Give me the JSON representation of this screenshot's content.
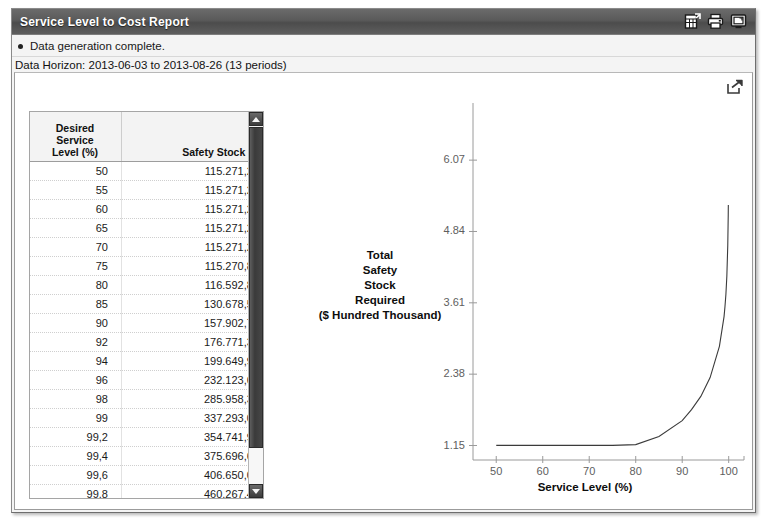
{
  "window": {
    "title": "Service Level to Cost Report",
    "icons": [
      {
        "name": "export-grid-icon",
        "label": "Export to spreadsheet"
      },
      {
        "name": "printer-icon",
        "label": "Print"
      },
      {
        "name": "display-icon",
        "label": "Display"
      }
    ]
  },
  "messages": {
    "status": "Data generation complete.",
    "horizon": "Data Horizon: 2013-06-03 to 2013-08-26 (13 periods)"
  },
  "content": {
    "export_icon": "share-export-icon"
  },
  "table": {
    "columns": [
      {
        "key": "level",
        "header_lines": [
          "Desired",
          "Service",
          "Level (%)"
        ],
        "header": "Desired Service Level (%)"
      },
      {
        "key": "stock",
        "header_lines": [
          "Safety Stock ($)"
        ],
        "header": "Safety Stock ($)"
      }
    ],
    "rows": [
      {
        "level": "50",
        "stock": "115.271,24"
      },
      {
        "level": "55",
        "stock": "115.271,24"
      },
      {
        "level": "60",
        "stock": "115.271,24"
      },
      {
        "level": "65",
        "stock": "115.271,24"
      },
      {
        "level": "70",
        "stock": "115.271,24"
      },
      {
        "level": "75",
        "stock": "115.270,84"
      },
      {
        "level": "80",
        "stock": "116.592,83"
      },
      {
        "level": "85",
        "stock": "130.678,58"
      },
      {
        "level": "90",
        "stock": "157.902,76"
      },
      {
        "level": "92",
        "stock": "176.771,33"
      },
      {
        "level": "94",
        "stock": "199.649,91"
      },
      {
        "level": "96",
        "stock": "232.123,68"
      },
      {
        "level": "98",
        "stock": "285.958,32"
      },
      {
        "level": "99",
        "stock": "337.293,05"
      },
      {
        "level": "99,2",
        "stock": "354.741,97"
      },
      {
        "level": "99,4",
        "stock": "375.696,61"
      },
      {
        "level": "99,6",
        "stock": "406.650,07"
      },
      {
        "level": "99,8",
        "stock": "460.267,44"
      },
      {
        "level": "99,9",
        "stock": "513.056,93"
      },
      {
        "level": "99,91",
        "stock": "520.905,76"
      },
      {
        "level": "99,92",
        "stock": "529.753,19"
      }
    ],
    "scrollbar": {
      "up_icon": "scroll-up-arrow",
      "down_icon": "scroll-down-arrow"
    }
  },
  "chart_data": {
    "type": "line",
    "title": "",
    "xlabel": "Service Level (%)",
    "ylabel": "Total Safety Stock Required ($ Hundred Thousand)",
    "ylabel_lines": [
      "Total",
      "Safety",
      "Stock",
      "Required",
      "($ Hundred Thousand)"
    ],
    "xlim": [
      45,
      102
    ],
    "ylim": [
      0.9,
      6.4
    ],
    "xticks": [
      "50",
      "60",
      "70",
      "80",
      "90",
      "100"
    ],
    "xtick_values": [
      50,
      60,
      70,
      80,
      90,
      100
    ],
    "yticks": [
      "1.15",
      "2.38",
      "3.61",
      "4.84",
      "6.07"
    ],
    "ytick_values": [
      1.15,
      2.38,
      3.61,
      4.84,
      6.07
    ],
    "grid": false,
    "legend": false,
    "line_color": "#3b3b3b",
    "x": [
      50,
      55,
      60,
      65,
      70,
      75,
      80,
      85,
      90,
      92,
      94,
      96,
      98,
      99,
      99.2,
      99.4,
      99.6,
      99.8,
      99.9,
      99.91,
      99.92
    ],
    "y": [
      1.1527,
      1.1527,
      1.1527,
      1.1527,
      1.1527,
      1.1527,
      1.1659,
      1.3068,
      1.579,
      1.7677,
      1.9965,
      2.3212,
      2.8596,
      3.3729,
      3.5474,
      3.757,
      4.0665,
      4.6027,
      5.1306,
      5.2091,
      5.2975
    ]
  }
}
